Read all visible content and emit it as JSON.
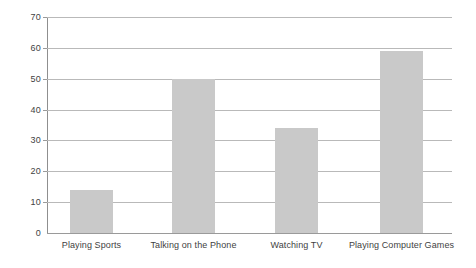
{
  "chart_data": {
    "type": "bar",
    "title": "",
    "subtitle": "",
    "xlabel": "",
    "ylabel": "",
    "categories": [
      "Playing Sports",
      "Talking on the Phone",
      "Watching TV",
      "Playing Computer Games"
    ],
    "values": [
      14,
      50,
      34,
      59
    ],
    "ylim": [
      0,
      70
    ],
    "ytick_step": 10,
    "yticks": [
      0,
      10,
      20,
      30,
      40,
      50,
      60,
      70
    ],
    "ytick_labels": [
      "0",
      "10",
      "20",
      "30",
      "40",
      "50",
      "60",
      "70"
    ],
    "grid": "horizontal",
    "legend": "none",
    "bar_color": "#c9c9c9",
    "gridline_color": "#b9b9b9",
    "axis_color": "#8f8f8f",
    "background_color": "#ffffff",
    "annotations": []
  }
}
